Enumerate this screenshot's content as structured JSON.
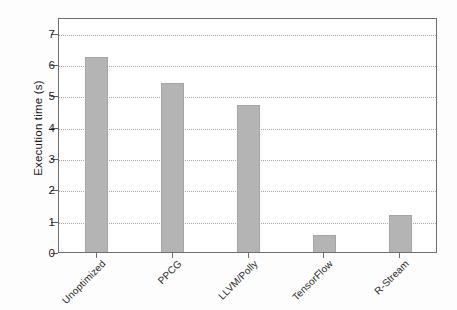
{
  "chart_data": {
    "type": "bar",
    "title": "",
    "xlabel": "",
    "ylabel": "Execution time (s)",
    "categories": [
      "Unoptimized",
      "PPCG",
      "LLVM/Polly",
      "TensorFlow",
      "R-Stream"
    ],
    "values": [
      6.3,
      5.45,
      4.75,
      0.62,
      1.25
    ],
    "ylim": [
      0,
      7.5
    ],
    "yticks": [
      0,
      1,
      2,
      3,
      4,
      5,
      6,
      7
    ],
    "ytick_labels": [
      "0",
      "1",
      "2",
      "3",
      "4",
      "5",
      "6",
      "7"
    ],
    "grid": true,
    "grid_axis": "y",
    "legend": null,
    "bar_color": "#b4b4b4",
    "bar_edge_color": "#a5a5a5",
    "frame_color": "#6e6e6e",
    "gridline_color": "#9a9a9a",
    "text_color": "#1c1c1c"
  }
}
